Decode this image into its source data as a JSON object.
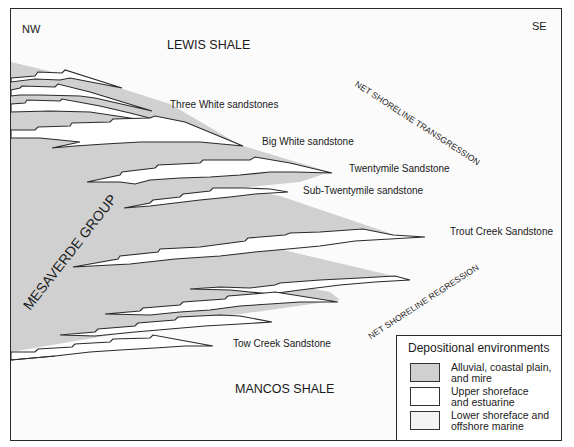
{
  "diagram": {
    "orientation": {
      "left": "NW",
      "right": "SE"
    },
    "formations": {
      "top": "LEWIS SHALE",
      "bottom": "MANCOS SHALE",
      "group": "MESAVERDE GROUP"
    },
    "units": [
      {
        "name": "Three White sandstones"
      },
      {
        "name": "Big White sandstone"
      },
      {
        "name": "Twentymile Sandstone"
      },
      {
        "name": "Sub-Twentymile sandstone"
      },
      {
        "name": "Trout Creek Sandstone"
      },
      {
        "name": "Tow Creek Sandstone"
      }
    ],
    "trends": {
      "upper": "NET SHORELINE TRANSGRESSION",
      "lower": "NET SHORELINE REGRESSION"
    },
    "legend": {
      "title": "Depositional environments",
      "items": [
        {
          "label_line1": "Alluvial, coastal plain,",
          "label_line2": "and mire",
          "color": "#d0d0d0"
        },
        {
          "label_line1": "Upper shoreface",
          "label_line2": "and estuarine",
          "color": "#ffffff"
        },
        {
          "label_line1": "Lower shoreface and",
          "label_line2": "offshore marine",
          "color": "#f4f4f4"
        }
      ]
    },
    "colors": {
      "alluvial": "#d0d0d0",
      "shoreface": "#ffffff",
      "marine": "#fbfbfb",
      "line": "#2a2a2a"
    }
  }
}
